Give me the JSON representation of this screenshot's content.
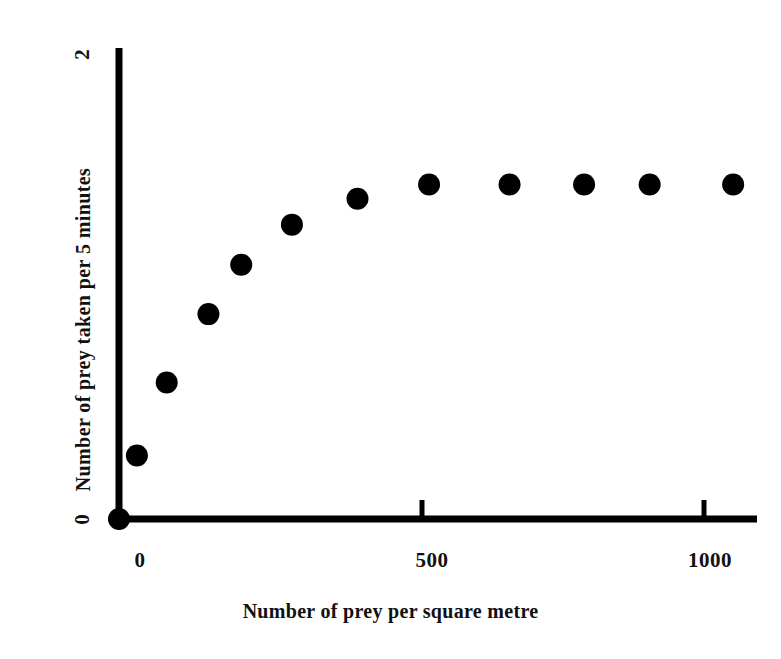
{
  "chart_data": {
    "type": "scatter",
    "title": "",
    "xlabel": "Number of prey per square metre",
    "ylabel": "Number of prey taken per 5 minutes",
    "xlim": [
      0,
      1070
    ],
    "ylim": [
      0,
      2
    ],
    "xticks": [
      0,
      500,
      1000
    ],
    "xtick_labels": [
      "0",
      "500",
      "1000"
    ],
    "yticks": [
      0,
      2
    ],
    "ytick_labels": [
      "0",
      "2"
    ],
    "grid": false,
    "legend": null,
    "marker": "filled-circle",
    "marker_color": "#000000",
    "series": [
      {
        "name": "Prey taken per 5 minutes",
        "x": [
          0,
          30,
          80,
          150,
          205,
          290,
          400,
          520,
          655,
          780,
          890,
          1030
        ],
        "y": [
          0.0,
          0.27,
          0.58,
          0.87,
          1.08,
          1.25,
          1.36,
          1.42,
          1.42,
          1.42,
          1.42,
          1.42
        ]
      }
    ]
  },
  "axes": {
    "x_title": "Number of prey per square metre",
    "y_title": "Number of prey taken per 5 minutes",
    "x_tick_0": "0",
    "x_tick_500": "500",
    "x_tick_1000": "1000",
    "y_tick_0": "0",
    "y_tick_2": "2"
  },
  "style": {
    "axis_color": "#000000",
    "marker_color": "#000000",
    "background": "#ffffff"
  }
}
